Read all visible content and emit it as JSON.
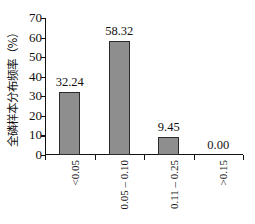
{
  "chart_data": {
    "type": "bar",
    "title": "",
    "subtitle": "",
    "xlabel": "",
    "ylabel": "全磷样本分布频率（%）",
    "categories": [
      "<0.05",
      "0.05 – 0.10",
      "0.11 – 0.25",
      ">0.15"
    ],
    "values": [
      32.24,
      58.32,
      9.45,
      0.0
    ],
    "value_labels": [
      "32.24",
      "58.32",
      "9.45",
      "0.00"
    ],
    "ylim": [
      0,
      70
    ],
    "yticks": [
      70,
      60,
      50,
      40,
      30,
      20,
      10,
      0
    ],
    "ytick_labels": [
      "70",
      "60",
      "50",
      "40",
      "30",
      "20",
      "10",
      "0"
    ],
    "grid": false,
    "legend": false,
    "legend_position": "none",
    "bar_color": "#8e8e8e",
    "bar_edge_color": "#2b2b2b",
    "axis_color": "#111111",
    "background_color": "#ffffff"
  }
}
